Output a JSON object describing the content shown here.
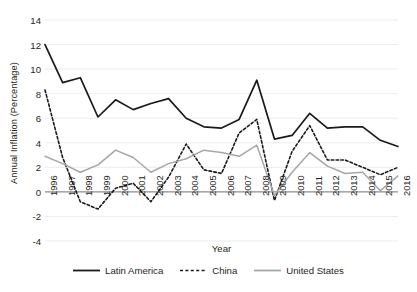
{
  "chart_data": {
    "type": "line",
    "title": "",
    "xlabel": "Year",
    "ylabel": "Annual Inflation (Percentage)",
    "x": [
      1996,
      1997,
      1998,
      1999,
      2000,
      2001,
      2002,
      2003,
      2004,
      2005,
      2006,
      2007,
      2008,
      2009,
      2010,
      2011,
      2012,
      2013,
      2014,
      2015,
      2016
    ],
    "categories": [
      "1996",
      "1997",
      "1998",
      "1999",
      "2000",
      "2001",
      "2002",
      "2003",
      "2004",
      "2005",
      "2006",
      "2007",
      "2008",
      "2009",
      "2010",
      "2011",
      "2012",
      "2013",
      "2014",
      "2015",
      "2016"
    ],
    "xlim": [
      1996,
      2016
    ],
    "ylim": [
      -4,
      14
    ],
    "yticks": [
      14,
      12,
      10,
      8,
      6,
      4,
      2,
      0,
      -2,
      -4
    ],
    "xticks": [
      "1996",
      "1997",
      "1998",
      "1999",
      "2000",
      "2001",
      "2002",
      "2003",
      "2004",
      "2005",
      "2006",
      "2007",
      "2008",
      "2009",
      "2010",
      "2011",
      "2012",
      "2013",
      "2014",
      "2015",
      "2016"
    ],
    "grid": true,
    "legend_position": "bottom",
    "series": [
      {
        "name": "Latin America",
        "style": "solid",
        "color": "#1a1a1a",
        "values": [
          12.0,
          8.9,
          9.3,
          6.1,
          7.5,
          6.7,
          7.2,
          7.6,
          6.0,
          5.3,
          5.2,
          5.9,
          9.1,
          4.3,
          4.6,
          6.4,
          5.2,
          5.3,
          5.3,
          4.2,
          3.7
        ]
      },
      {
        "name": "China",
        "style": "dashed",
        "color": "#1a1a1a",
        "values": [
          8.3,
          2.8,
          -0.8,
          -1.4,
          0.3,
          0.7,
          -0.8,
          1.2,
          3.9,
          1.8,
          1.5,
          4.8,
          5.9,
          -0.7,
          3.3,
          5.4,
          2.6,
          2.6,
          2.0,
          1.4,
          2.0
        ]
      },
      {
        "name": "United States",
        "style": "solid",
        "color": "#a6a6a6",
        "values": [
          2.9,
          2.3,
          1.6,
          2.2,
          3.4,
          2.8,
          1.6,
          2.3,
          2.7,
          3.4,
          3.2,
          2.9,
          3.8,
          -0.3,
          1.6,
          3.2,
          2.1,
          1.5,
          1.6,
          0.1,
          1.3
        ]
      }
    ]
  },
  "axes": {
    "y_title": "Annual Inflation (Percentage)",
    "x_title": "Year"
  },
  "legend": {
    "items": [
      {
        "label": "Latin America",
        "icon": "solid-black-line-swatch"
      },
      {
        "label": "China",
        "icon": "dashed-black-line-swatch"
      },
      {
        "label": "United States",
        "icon": "solid-gray-line-swatch"
      }
    ]
  },
  "colors": {
    "latin_america": "#1a1a1a",
    "china": "#1a1a1a",
    "united_states": "#a6a6a6",
    "grid": "#e9e9ec",
    "zero_axis": "#8d8d90",
    "text": "#231f20",
    "background": "#ffffff"
  }
}
